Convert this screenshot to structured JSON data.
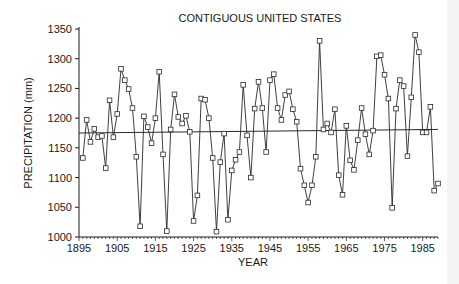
{
  "chart_data": {
    "type": "line",
    "title": "CONTIGUOUS UNITED STATES",
    "xlabel": "YEAR",
    "ylabel": "PRECIPITATION (mm)",
    "xlim": [
      1895,
      1989
    ],
    "ylim": [
      1000,
      1350
    ],
    "x_ticks": [
      1895,
      1905,
      1915,
      1925,
      1935,
      1945,
      1955,
      1965,
      1975,
      1985
    ],
    "y_ticks": [
      1000,
      1050,
      1100,
      1150,
      1200,
      1250,
      1300,
      1350
    ],
    "grid": false,
    "legend": null,
    "marker": "square",
    "series": [
      {
        "name": "Annual precipitation",
        "x": [
          1896,
          1897,
          1898,
          1899,
          1900,
          1901,
          1902,
          1903,
          1904,
          1905,
          1906,
          1907,
          1908,
          1909,
          1910,
          1911,
          1912,
          1913,
          1914,
          1915,
          1916,
          1917,
          1918,
          1919,
          1920,
          1921,
          1922,
          1923,
          1924,
          1925,
          1926,
          1927,
          1928,
          1929,
          1930,
          1931,
          1932,
          1933,
          1934,
          1935,
          1936,
          1937,
          1938,
          1939,
          1940,
          1941,
          1942,
          1943,
          1944,
          1945,
          1946,
          1947,
          1948,
          1949,
          1950,
          1951,
          1952,
          1953,
          1954,
          1955,
          1956,
          1957,
          1958,
          1959,
          1960,
          1961,
          1962,
          1963,
          1964,
          1965,
          1966,
          1967,
          1968,
          1969,
          1970,
          1971,
          1972,
          1973,
          1974,
          1975,
          1976,
          1977,
          1978,
          1979,
          1980,
          1981,
          1982,
          1983,
          1984,
          1985,
          1986,
          1987,
          1988,
          1989
        ],
        "values": [
          1133,
          1197,
          1160,
          1182,
          1168,
          1170,
          1116,
          1230,
          1168,
          1207,
          1283,
          1264,
          1249,
          1217,
          1135,
          1018,
          1203,
          1185,
          1158,
          1200,
          1278,
          1139,
          1010,
          1181,
          1240,
          1202,
          1191,
          1204,
          1177,
          1027,
          1070,
          1233,
          1231,
          1200,
          1133,
          1009,
          1126,
          1174,
          1029,
          1112,
          1130,
          1143,
          1256,
          1171,
          1100,
          1216,
          1261,
          1217,
          1143,
          1264,
          1274,
          1217,
          1197,
          1239,
          1245,
          1215,
          1194,
          1115,
          1087,
          1058,
          1087,
          1135,
          1330,
          1181,
          1191,
          1176,
          1215,
          1104,
          1071,
          1187,
          1129,
          1113,
          1163,
          1217,
          1173,
          1139,
          1179,
          1304,
          1306,
          1273,
          1233,
          1049,
          1216,
          1264,
          1254,
          1136,
          1235,
          1340,
          1311,
          1176,
          1176,
          1219,
          1078,
          1090
        ]
      },
      {
        "name": "Linear trend",
        "x": [
          1895,
          1989
        ],
        "values": [
          1175,
          1181
        ]
      }
    ]
  },
  "labels": {
    "title": "CONTIGUOUS UNITED STATES",
    "xlabel": "YEAR",
    "ylabel": "PRECIPITATION (mm)"
  },
  "colors": {
    "line": "#2a2a2a",
    "marker_fill": "#ffffff",
    "axis": "#1a1a1a",
    "background": "#ffffff"
  }
}
